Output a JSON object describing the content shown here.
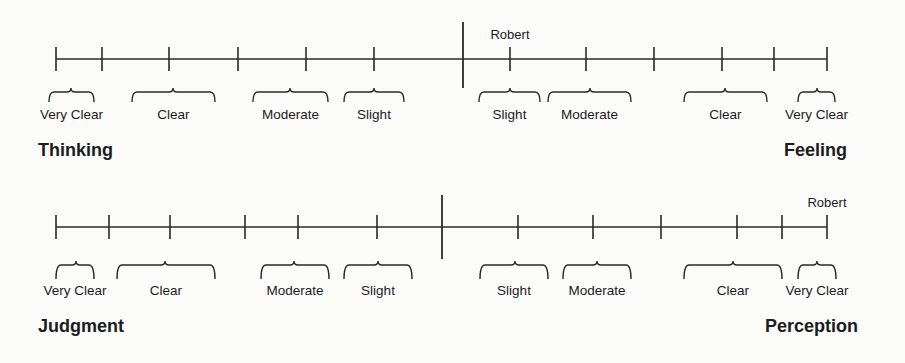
{
  "diagram": {
    "scales": [
      {
        "id": "thinking-feeling",
        "left_pole": "Thinking",
        "right_pole": "Feeling",
        "line_y": 59,
        "x_start": 56,
        "x_end": 827,
        "center_x": 463,
        "center_top": 22,
        "center_bottom": 88,
        "tick_half": 12,
        "ticks": [
          56,
          102,
          169,
          238,
          306,
          374,
          510,
          586,
          654,
          722,
          774,
          827
        ],
        "marker": {
          "label": "Robert",
          "x": 510,
          "side": "Feeling",
          "category": "Slight"
        },
        "brace_top": 88,
        "brace_bottom": 102,
        "label_y": 119,
        "pole_y": 156,
        "left_pole_x": 38,
        "right_pole_x": 847,
        "braces": [
          {
            "label": "Very Clear",
            "x1": 49,
            "x2": 94,
            "tip": 71
          },
          {
            "label": "Clear",
            "x1": 132,
            "x2": 215,
            "tip": 173
          },
          {
            "label": "Moderate",
            "x1": 253,
            "x2": 328,
            "tip": 290
          },
          {
            "label": "Slight",
            "x1": 344,
            "x2": 404,
            "tip": 374
          },
          {
            "label": "Slight",
            "x1": 479,
            "x2": 540,
            "tip": 510
          },
          {
            "label": "Moderate",
            "x1": 548,
            "x2": 631,
            "tip": 590
          },
          {
            "label": "Clear",
            "x1": 684,
            "x2": 767,
            "tip": 725
          },
          {
            "label": "Very Clear",
            "x1": 798,
            "x2": 835,
            "tip": 817
          }
        ]
      },
      {
        "id": "judgment-perception",
        "left_pole": "Judgment",
        "right_pole": "Perception",
        "line_y": 227,
        "x_start": 56,
        "x_end": 827,
        "center_x": 442,
        "center_top": 195,
        "center_bottom": 259,
        "tick_half": 12,
        "ticks": [
          56,
          109,
          170,
          245,
          298,
          377,
          518,
          593,
          661,
          737,
          782,
          827
        ],
        "marker": {
          "label": "Robert",
          "x": 827,
          "side": "Perception",
          "category": "Very Clear"
        },
        "brace_top": 261,
        "brace_bottom": 279,
        "label_y": 295,
        "pole_y": 332,
        "left_pole_x": 38,
        "right_pole_x": 858,
        "braces": [
          {
            "label": "Very Clear",
            "x1": 56,
            "x2": 94,
            "tip": 76
          },
          {
            "label": "Clear",
            "x1": 117,
            "x2": 215,
            "tip": 165
          },
          {
            "label": "Moderate",
            "x1": 261,
            "x2": 329,
            "tip": 294
          },
          {
            "label": "Slight",
            "x1": 344,
            "x2": 412,
            "tip": 378
          },
          {
            "label": "Slight",
            "x1": 480,
            "x2": 548,
            "tip": 515
          },
          {
            "label": "Moderate",
            "x1": 563,
            "x2": 631,
            "tip": 597
          },
          {
            "label": "Clear",
            "x1": 684,
            "x2": 782,
            "tip": 733
          },
          {
            "label": "Very Clear",
            "x1": 798,
            "x2": 836,
            "tip": 817
          }
        ]
      }
    ]
  }
}
